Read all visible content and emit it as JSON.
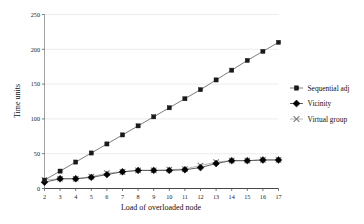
{
  "chart_data": {
    "type": "line",
    "title": "",
    "xlabel": "Load of overloaded node",
    "ylabel": "Time units",
    "x": [
      2,
      3,
      4,
      5,
      6,
      7,
      8,
      9,
      10,
      11,
      12,
      13,
      14,
      15,
      16,
      17
    ],
    "categories": [
      "2",
      "3",
      "4",
      "5",
      "6",
      "7",
      "8",
      "9",
      "10",
      "11",
      "12",
      "13",
      "14",
      "15",
      "16",
      "17"
    ],
    "xlim": [
      2,
      17
    ],
    "ylim": [
      0,
      250
    ],
    "yticks": [
      0,
      50,
      100,
      150,
      200,
      250
    ],
    "ytick_labels": [
      "0",
      "50",
      "100",
      "150",
      "200",
      "250"
    ],
    "grid": true,
    "grid_axis": "y",
    "legend_position": "right",
    "series": [
      {
        "name": "Sequential adj",
        "marker": "square",
        "color": "#1a1a1a",
        "line_color": "#6e6e6e",
        "values": [
          12,
          25,
          38,
          51,
          64,
          77,
          90,
          103,
          116,
          129,
          142,
          156,
          170,
          184,
          197,
          210
        ]
      },
      {
        "name": "Vicinity",
        "marker": "diamond",
        "color": "#000000",
        "line_color": "#4d4d4d",
        "values": [
          9,
          14,
          14,
          16,
          20,
          24,
          26,
          26,
          26,
          27,
          30,
          36,
          40,
          40,
          41,
          41
        ]
      },
      {
        "name": "Virtual group",
        "marker": "cross",
        "color": "#7a7a7a",
        "line_color": "#b0b0b0",
        "values": [
          12,
          14,
          14,
          17,
          22,
          24,
          26,
          26,
          27,
          28,
          33,
          38,
          40,
          40,
          41,
          41
        ]
      }
    ]
  },
  "legend": {
    "entries": [
      {
        "label": "Sequential adj"
      },
      {
        "label": "Vicinity"
      },
      {
        "label": "Virtual group"
      }
    ]
  },
  "axes": {
    "x_title": "Load of overloaded node",
    "y_title": "Time units"
  }
}
